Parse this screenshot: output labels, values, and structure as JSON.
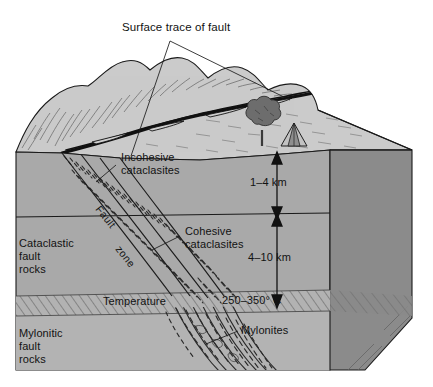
{
  "figure": {
    "type": "geologic-block-diagram",
    "title_label": "Surface trace of fault"
  },
  "labels": {
    "surface_trace": "Surface trace of fault",
    "incohesive_cataclasites_line1": "Incohesive",
    "incohesive_cataclasites_line2": "cataclasites",
    "cohesive_cataclasites_line1": "Cohesive",
    "cohesive_cataclasites_line2": "cataclasites",
    "cataclastic_line1": "Cataclastic",
    "cataclastic_line2": "fault",
    "cataclastic_line3": "rocks",
    "mylonitic_line1": "Mylonitic",
    "mylonitic_line2": "fault",
    "mylonitic_line3": "rocks",
    "mylonites": "Mylonites",
    "fault_zone_word1": "Fault",
    "fault_zone_word2": "zone",
    "temperature": "Temperature",
    "temperature_value": "250–350° C",
    "depth_upper": "1–4 km",
    "depth_lower": "4–10 km"
  },
  "scene_elements": {
    "tree": "tree",
    "tent": "tent",
    "hills": "hill-ridge",
    "fault_trace": "fault-surface-trace"
  },
  "depths": [
    {
      "range": "1–4 km",
      "zone": "Incohesive cataclasites"
    },
    {
      "range": "4–10 km",
      "zone": "Cohesive cataclasites"
    }
  ],
  "rock_zones": [
    {
      "name": "Cataclastic fault rocks",
      "depth": "0–10 km"
    },
    {
      "name": "Mylonitic fault rocks",
      "depth": ">10 km"
    }
  ],
  "colors": {
    "top_surface": "#c9c9c9",
    "front_face": "#a8a8a8",
    "front_face_lower": "#b4b4b4",
    "right_face": "#8a8a8a",
    "temperature_band": "#b0b0b0",
    "line": "#1a1a1a",
    "text": "#121212",
    "background": "#ffffff"
  }
}
